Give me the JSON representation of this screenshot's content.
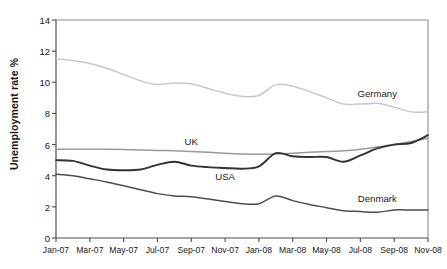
{
  "chart_data": {
    "type": "line",
    "title": "",
    "xlabel": "",
    "ylabel": "Unemployment rate %",
    "ylim": [
      0,
      14
    ],
    "yticks": [
      0,
      2,
      4,
      6,
      8,
      10,
      12,
      14
    ],
    "grid": false,
    "legend_position": "inline-annotations",
    "x_tick_labels": [
      "Jan-07",
      "Mar-07",
      "May-07",
      "Jul-07",
      "Sep-07",
      "Nov-07",
      "Jan-08",
      "Mar-08",
      "May-08",
      "Jul-08",
      "Sep-08",
      "Nov-08"
    ],
    "x": [
      "Jan-07",
      "Feb-07",
      "Mar-07",
      "Apr-07",
      "May-07",
      "Jun-07",
      "Jul-07",
      "Aug-07",
      "Sep-07",
      "Oct-07",
      "Nov-07",
      "Dec-07",
      "Jan-08",
      "Feb-08",
      "Mar-08",
      "Apr-08",
      "May-08",
      "Jun-08",
      "Jul-08",
      "Aug-08",
      "Sep-08",
      "Oct-08",
      "Nov-08"
    ],
    "series": [
      {
        "name": "Germany",
        "color": "#c8c8c8",
        "label_x": "Aug-08",
        "label_y": 9.3,
        "values": [
          11.5,
          11.4,
          11.2,
          10.9,
          10.5,
          10.1,
          9.85,
          9.95,
          9.9,
          9.6,
          9.3,
          9.1,
          9.15,
          9.85,
          9.75,
          9.4,
          9.0,
          8.6,
          8.6,
          8.65,
          8.4,
          8.1,
          8.1
        ]
      },
      {
        "name": "UK",
        "color": "#9a9a9a",
        "label_x": "Sep-07",
        "label_y": 6.2,
        "values": [
          5.7,
          5.7,
          5.7,
          5.7,
          5.68,
          5.65,
          5.62,
          5.6,
          5.55,
          5.5,
          5.45,
          5.4,
          5.38,
          5.4,
          5.45,
          5.5,
          5.55,
          5.6,
          5.7,
          5.85,
          6.0,
          6.2,
          6.4
        ]
      },
      {
        "name": "USA",
        "color": "#333333",
        "label_x": "Nov-07",
        "label_y": 4.0,
        "values": [
          5.0,
          4.95,
          4.65,
          4.4,
          4.35,
          4.4,
          4.7,
          4.9,
          4.65,
          4.55,
          4.5,
          4.45,
          4.6,
          5.45,
          5.25,
          5.2,
          5.2,
          4.9,
          5.3,
          5.75,
          6.0,
          6.1,
          6.6
        ]
      },
      {
        "name": "Denmark",
        "color": "#4d4d4d",
        "label_x": "Aug-08",
        "label_y": 2.6,
        "values": [
          4.1,
          4.0,
          3.8,
          3.6,
          3.35,
          3.1,
          2.85,
          2.7,
          2.65,
          2.5,
          2.35,
          2.2,
          2.2,
          2.7,
          2.4,
          2.15,
          1.95,
          1.75,
          1.7,
          1.65,
          1.8,
          1.8,
          1.8
        ]
      }
    ]
  },
  "axes": {
    "y_label_text": "Unemployment rate %"
  }
}
